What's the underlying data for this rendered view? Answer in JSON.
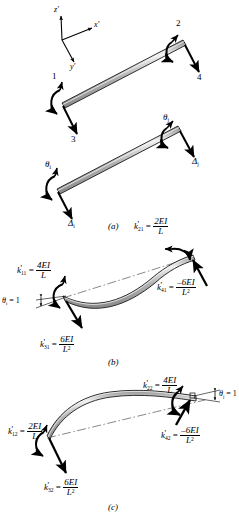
{
  "figure": {
    "type": "beam-element-stiffness-coefficients",
    "axes": {
      "z": "z'",
      "x": "x'",
      "y": "y'"
    },
    "panels": [
      {
        "tag": "(a)",
        "caption": "(a)",
        "description": "Beam element degrees of freedom and displacements",
        "labels": [
          {
            "name": "dof-1",
            "text": "1"
          },
          {
            "name": "dof-2",
            "text": "2"
          },
          {
            "name": "dof-3",
            "text": "3"
          },
          {
            "name": "dof-4",
            "text": "4"
          },
          {
            "name": "theta-i",
            "text": "θ",
            "sub": "i"
          },
          {
            "name": "theta-j",
            "text": "θ",
            "sub": "j"
          },
          {
            "name": "delta-i",
            "text": "Δ",
            "sub": "i"
          },
          {
            "name": "delta-j",
            "text": "Δ",
            "sub": "j"
          }
        ]
      },
      {
        "tag": "(b)",
        "caption": "(b)",
        "description": "Unit rotation at near end, theta_i = 1",
        "unit_rotation": {
          "symbol": "θ",
          "sub": "i",
          "equals": "= 1"
        },
        "coefficients": [
          {
            "name": "k11",
            "k": "k",
            "prime": "'",
            "sub": "11",
            "eq": "=",
            "num": "4EI",
            "den": "L"
          },
          {
            "name": "k21",
            "k": "k",
            "prime": "'",
            "sub": "21",
            "eq": "=",
            "num": "2EI",
            "den": "L"
          },
          {
            "name": "k31",
            "k": "k",
            "prime": "'",
            "sub": "31",
            "eq": "=",
            "num": "6EI",
            "den": "L",
            "den_sup": "2"
          },
          {
            "name": "k41",
            "k": "k",
            "prime": "'",
            "sub": "41",
            "eq": "=",
            "num": "–6EI",
            "den": "L",
            "den_sup": "2"
          }
        ]
      },
      {
        "tag": "(c)",
        "caption": "(c)",
        "description": "Unit rotation at far end, theta_j = 1",
        "unit_rotation": {
          "symbol": "θ",
          "sub": "j",
          "equals": "= 1"
        },
        "coefficients": [
          {
            "name": "k12",
            "k": "k",
            "prime": "'",
            "sub": "12",
            "eq": "=",
            "num": "2EI",
            "den": "L"
          },
          {
            "name": "k22",
            "k": "k",
            "prime": "'",
            "sub": "22",
            "eq": "=",
            "num": "4EI",
            "den": "L"
          },
          {
            "name": "k32",
            "k": "k",
            "prime": "'",
            "sub": "32",
            "eq": "=",
            "num": "6EI",
            "den": "L",
            "den_sup": "2"
          },
          {
            "name": "k42",
            "k": "k",
            "prime": "'",
            "sub": "42",
            "eq": "=",
            "num": "–6EI",
            "den": "L",
            "den_sup": "2"
          }
        ]
      }
    ],
    "colors": {
      "beam_fill": "#b4b4b4",
      "beam_light": "#e6e6e6",
      "beam_outline": "#1a1a1a",
      "arrow": "#000000",
      "centerline": "#555555",
      "background": "#ffffff"
    }
  }
}
